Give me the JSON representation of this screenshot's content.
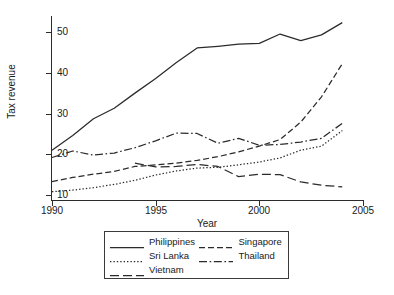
{
  "chart_data": {
    "type": "line",
    "title": "",
    "xlabel": "Year",
    "ylabel": "Tax revenue",
    "xlim": [
      1990,
      2005
    ],
    "ylim": [
      8.5,
      53.5
    ],
    "xticks": [
      1990,
      1995,
      2000,
      2005
    ],
    "yticks": [
      10,
      20,
      30,
      40,
      50
    ],
    "grid": false,
    "legend_position": "below-axes",
    "series": [
      {
        "name": "Philippines",
        "style": "solid",
        "x": [
          1990,
          1991,
          1992,
          1993,
          1994,
          1995,
          1996,
          1997,
          1998,
          1999,
          2000,
          2001,
          2002,
          2003,
          2004
        ],
        "values": [
          21.0,
          24.6,
          28.7,
          31.3,
          35.0,
          38.6,
          42.5,
          46.1,
          46.5,
          47.0,
          47.2,
          49.5,
          47.9,
          49.3,
          52.3
        ]
      },
      {
        "name": "Singapore",
        "style": "dashed",
        "x": [
          1990,
          1991,
          1992,
          1993,
          1994,
          1995,
          1996,
          1997,
          1998,
          1999,
          2000,
          2001,
          2002,
          2003,
          2004
        ],
        "values": [
          13.3,
          14.3,
          15.1,
          15.8,
          17.0,
          17.4,
          17.8,
          18.5,
          19.4,
          20.6,
          22.0,
          23.6,
          27.9,
          34.1,
          42.2
        ]
      },
      {
        "name": "Sri Lanka",
        "style": "dotted",
        "x": [
          1990,
          1991,
          1992,
          1993,
          1994,
          1995,
          1996,
          1997,
          1998,
          1999,
          2000,
          2001,
          2002,
          2003,
          2004
        ],
        "values": [
          10.8,
          11.2,
          11.8,
          12.6,
          13.6,
          14.9,
          15.9,
          16.6,
          16.8,
          17.4,
          18.1,
          19.1,
          21.0,
          22.0,
          25.8
        ]
      },
      {
        "name": "Thailand",
        "style": "dashdot",
        "x": [
          1990,
          1991,
          1992,
          1993,
          1994,
          1995,
          1996,
          1997,
          1998,
          1999,
          2000,
          2001,
          2002,
          2003,
          2004
        ],
        "values": [
          19.2,
          20.8,
          19.8,
          20.3,
          21.6,
          23.3,
          25.2,
          25.1,
          22.7,
          23.9,
          22.2,
          22.4,
          23.0,
          23.9,
          27.6
        ]
      },
      {
        "name": "Vietnam",
        "style": "longdash",
        "x": [
          1994,
          1995,
          1996,
          1997,
          1998,
          1999,
          2000,
          2001,
          2002,
          2003,
          2004
        ],
        "values": [
          17.8,
          16.9,
          17.0,
          17.5,
          17.0,
          14.5,
          15.1,
          15.0,
          13.2,
          12.4,
          12.0
        ]
      }
    ]
  },
  "axes": {
    "y_title": "Tax revenue",
    "x_title": "Year",
    "y_tick_labels": [
      "50",
      "40",
      "30",
      "20",
      "10"
    ],
    "x_tick_labels": [
      "1990",
      "1995",
      "2000",
      "2005"
    ]
  },
  "legend": {
    "rows": [
      [
        {
          "label": "Philippines",
          "style": "solid"
        },
        {
          "label": "Singapore",
          "style": "dashed"
        }
      ],
      [
        {
          "label": "Sri Lanka",
          "style": "dotted"
        },
        {
          "label": "Thailand",
          "style": "dashdot"
        }
      ],
      [
        {
          "label": "Vietnam",
          "style": "longdash"
        }
      ]
    ]
  },
  "colors": {
    "line": "#2b2b2b",
    "axis": "#2b2b2b",
    "text": "#1a1a1a",
    "background": "#ffffff",
    "legend_border": "#3a3a3a"
  }
}
